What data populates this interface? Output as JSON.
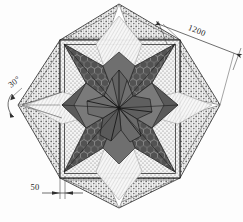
{
  "drawing": {
    "title": "Star paving pattern plan",
    "type": "technical-plan",
    "scale_note": "",
    "units": "mm"
  },
  "dimensions": [
    {
      "id": "overall-width",
      "label": "1200",
      "position": "top-right-diagonal",
      "rotation_deg": -21,
      "x": 196,
      "y": 33
    },
    {
      "id": "border-width",
      "label": "50",
      "position": "bottom-left",
      "rotation_deg": 0,
      "x": 35,
      "y": 189
    },
    {
      "id": "point-angle",
      "label": "30°",
      "position": "left-vertex",
      "rotation_deg": -38,
      "x": 14,
      "y": 84
    }
  ],
  "geometry": {
    "outer_square": {
      "name": "rotated-square-45",
      "center": [
        119,
        105
      ],
      "half_diagonal": 104
    },
    "inner_square": {
      "name": "frame-square",
      "left": 60,
      "top": 40,
      "right": 180,
      "bottom": 178,
      "border_width": 4
    },
    "star": {
      "name": "six-pointed-star",
      "center": [
        119,
        108
      ],
      "outer_radius": 76,
      "inner_radius": 30,
      "points": 6,
      "rotation_deg": 0
    },
    "rosette": {
      "name": "central-petal-rosette",
      "center": [
        119,
        108
      ],
      "radius": 26,
      "petals": 6
    }
  },
  "colors": {
    "paper": "#fdfdfd",
    "line": "#2a2a2a",
    "star_dark": "#4f4f4f",
    "star_mid": "#6d6d6d",
    "star_light": "#8a8a8a",
    "rosette": "#707070",
    "stipple_bg": "#f2f2f2",
    "gable_fill": "#eeeeee",
    "dim_line": "#3a3a3a"
  },
  "hatch_legend": {
    "cobble": "hexagonal-cobble-texture",
    "stipple": "fine-dot-stipple",
    "coarse": "coarse-granule-stipple"
  }
}
